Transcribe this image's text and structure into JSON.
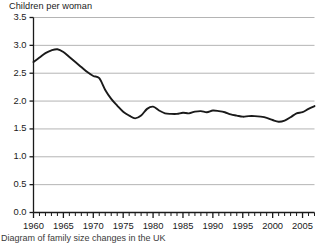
{
  "figure": {
    "caption": "Diagram of family size changes in the UK"
  },
  "chart_data": {
    "type": "line",
    "title": "Children per woman",
    "xlabel": "",
    "ylabel": "Children per woman",
    "xlim": [
      1960,
      2007
    ],
    "ylim": [
      0.0,
      3.5
    ],
    "grid": true,
    "legend": "none",
    "y_ticks": [
      "0.0",
      "0.5",
      "1.0",
      "1.5",
      "2.0",
      "2.5",
      "3.0",
      "3.5"
    ],
    "y_tick_values": [
      0.0,
      0.5,
      1.0,
      1.5,
      2.0,
      2.5,
      3.0,
      3.5
    ],
    "x_ticks": [
      "1960",
      "1965",
      "1970",
      "1975",
      "1980",
      "1985",
      "1990",
      "1995",
      "2000",
      "2005"
    ],
    "x_tick_values": [
      1960,
      1965,
      1970,
      1975,
      1980,
      1985,
      1990,
      1995,
      2000,
      2005
    ],
    "x_minor_tick_step": 1,
    "line_color": "#1a1a1a",
    "grid_color": "#b4b4b4",
    "series": [
      {
        "name": "Children per woman",
        "x": [
          1960,
          1961,
          1962,
          1963,
          1964,
          1965,
          1966,
          1967,
          1968,
          1969,
          1970,
          1971,
          1972,
          1973,
          1974,
          1975,
          1976,
          1977,
          1978,
          1979,
          1980,
          1981,
          1982,
          1983,
          1984,
          1985,
          1986,
          1987,
          1988,
          1989,
          1990,
          1991,
          1992,
          1993,
          1994,
          1995,
          1996,
          1997,
          1998,
          1999,
          2000,
          2001,
          2002,
          2003,
          2004,
          2005,
          2006,
          2007
        ],
        "values": [
          2.7,
          2.78,
          2.86,
          2.91,
          2.93,
          2.88,
          2.79,
          2.7,
          2.61,
          2.52,
          2.45,
          2.41,
          2.2,
          2.04,
          1.92,
          1.81,
          1.74,
          1.69,
          1.74,
          1.86,
          1.9,
          1.83,
          1.78,
          1.77,
          1.77,
          1.79,
          1.78,
          1.81,
          1.82,
          1.8,
          1.83,
          1.82,
          1.8,
          1.76,
          1.74,
          1.72,
          1.73,
          1.73,
          1.72,
          1.7,
          1.66,
          1.63,
          1.65,
          1.71,
          1.78,
          1.8,
          1.86,
          1.91
        ]
      }
    ]
  }
}
